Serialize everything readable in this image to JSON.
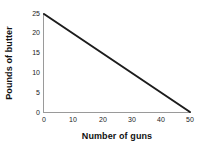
{
  "chart_data": {
    "type": "line",
    "title": "",
    "xlabel": "Number of guns",
    "ylabel": "Pounds of butter",
    "xlim": [
      0,
      50
    ],
    "ylim": [
      0,
      25
    ],
    "xticks": [
      0,
      10,
      20,
      30,
      40,
      50
    ],
    "yticks": [
      0,
      5,
      10,
      15,
      20,
      25
    ],
    "xtick_labels": [
      "0",
      "10",
      "20",
      "30",
      "40",
      "50"
    ],
    "ytick_labels": [
      "0",
      "5",
      "10",
      "15",
      "20",
      "25"
    ],
    "grid": false,
    "legend": null,
    "series": [
      {
        "name": "production possibilities frontier",
        "x": [
          0,
          50
        ],
        "values": [
          25,
          0
        ],
        "color": "#1c1c1c",
        "line_width": 2
      }
    ],
    "annotations": [],
    "axis_color": "#9a9a9a",
    "background": "#ffffff"
  }
}
